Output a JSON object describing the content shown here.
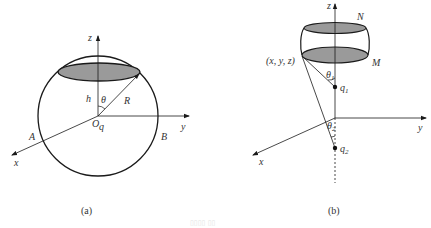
{
  "figure": {
    "panels": [
      {
        "id": "a",
        "caption": "(a)",
        "description": "Sphere of radius R centered at charge q at origin O, with a circular cap cross-section at height h; angle theta between z-axis and radius R",
        "labels": {
          "z_axis": "z",
          "y_axis": "y",
          "x_axis": "x",
          "height": "h",
          "angle": "θ",
          "radius": "R",
          "origin": "O",
          "charge": "q",
          "point_a": "A",
          "point_b": "B"
        }
      },
      {
        "id": "b",
        "caption": "(b)",
        "description": "Barrel-shaped surface bounded by disks N (top) and M (bottom); point (x, y, z) on rim of M connected to charges q1 and q2 on the z-axis with angles theta1 and theta2",
        "labels": {
          "z_axis": "z",
          "y_axis": "y",
          "x_axis": "x",
          "top_disk": "N",
          "bottom_disk": "M",
          "point": "(x, y, z)",
          "angle1": "θ",
          "angle1_sub": "1",
          "angle2": "θ",
          "angle2_sub": "2",
          "charge1": "q",
          "charge1_sub": "1",
          "charge2": "q",
          "charge2_sub": "2"
        }
      }
    ],
    "footer_faint": "▯▯▯▯ ▯▯"
  },
  "colors": {
    "line": "#1a1a1a",
    "disk_fill": "#9a9a9a",
    "text": "#333333"
  }
}
